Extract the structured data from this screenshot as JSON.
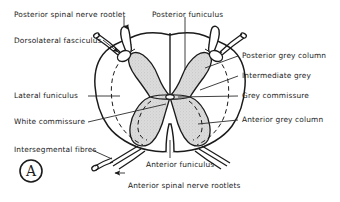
{
  "figure": {
    "panel_letter": "A",
    "colors": {
      "background": "#ffffff",
      "ink": "#1b1b1b",
      "grey_matter_fill": "#d9d9d9",
      "white_matter_fill": "#ffffff",
      "leader_line": "#2b2b2b"
    }
  },
  "labels": {
    "posterior_spinal_nerve_rootlet": "Posterior spinal nerve rootlet",
    "posterior_funiculus": "Posterior funiculus",
    "dorsolateral_fasciculus": "Dorsolateral fasciculus",
    "posterior_grey_column": "Posterior grey column",
    "intermediate_grey": "Intermediate grey",
    "lateral_funiculus": "Lateral funiculus",
    "grey_commissure": "Grey commissure",
    "white_commissure": "White commissure",
    "anterior_grey_column": "Anterior grey column",
    "intersegmental_fibres": "Intersegmental fibres",
    "anterior_funiculus": "Anterior funiculus",
    "anterior_spinal_nerve_rootlets": "Anterior spinal nerve rootlets"
  }
}
